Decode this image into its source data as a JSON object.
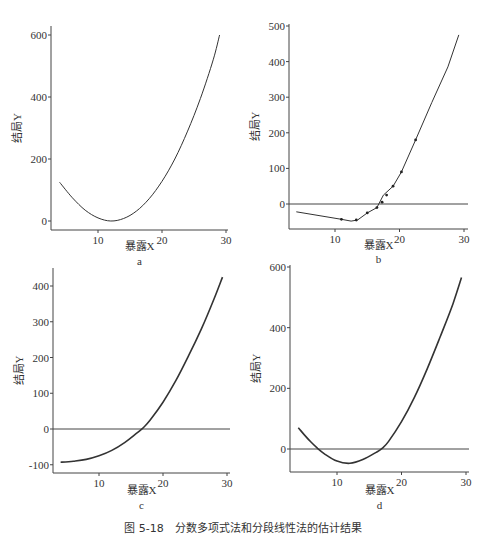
{
  "caption": "图 5-18　分数多项式法和分段线性法的估计结果",
  "chart_data": [
    {
      "id": "a",
      "type": "line",
      "subtitle": "a",
      "xlabel": "暴露X",
      "ylabel": "结局Y",
      "xlim": [
        3,
        30
      ],
      "ylim": [
        -25,
        620
      ],
      "xticks": [
        10,
        20,
        30
      ],
      "yticks": [
        0,
        200,
        400,
        600
      ],
      "zero_line": false,
      "grid": false,
      "series": [
        {
          "name": "fit",
          "x": [
            4,
            6,
            8,
            10,
            12,
            14,
            16,
            18,
            20,
            22,
            24,
            26,
            28,
            29
          ],
          "y": [
            125,
            75,
            35,
            10,
            0,
            8,
            32,
            72,
            128,
            200,
            290,
            395,
            520,
            600
          ]
        }
      ]
    },
    {
      "id": "b",
      "type": "line",
      "subtitle": "b",
      "xlabel": "暴露X",
      "ylabel": "结局Y",
      "xlim": [
        3,
        30
      ],
      "ylim": [
        -75,
        510
      ],
      "xticks": [
        10,
        20,
        30
      ],
      "yticks": [
        0,
        100,
        200,
        300,
        400,
        500
      ],
      "zero_line": true,
      "grid": false,
      "series": [
        {
          "name": "piecewise",
          "x": [
            4,
            11,
            12.5,
            13.5,
            15,
            16.5,
            17.5,
            19,
            20.3,
            22.5,
            25,
            27.5,
            29.2
          ],
          "y": [
            -22,
            -43,
            -48,
            -45,
            -25,
            -10,
            25,
            50,
            90,
            180,
            285,
            385,
            475
          ]
        },
        {
          "name": "knots",
          "type": "scatter",
          "x": [
            11,
            13.3,
            15,
            16.5,
            17.3,
            18,
            19,
            20.3,
            22.5
          ],
          "y": [
            -43,
            -45,
            -25,
            -10,
            5,
            25,
            50,
            90,
            180
          ]
        }
      ]
    },
    {
      "id": "c",
      "type": "line",
      "subtitle": "c",
      "xlabel": "暴露X",
      "ylabel": "结局Y",
      "xlim": [
        3,
        30
      ],
      "ylim": [
        -120,
        440
      ],
      "xticks": [
        10,
        20,
        30
      ],
      "yticks": [
        -100,
        0,
        100,
        200,
        300,
        400
      ],
      "zero_line": true,
      "grid": false,
      "series": [
        {
          "name": "fit",
          "x": [
            4,
            6,
            8,
            10,
            12,
            14,
            16,
            17,
            18,
            20,
            22,
            24,
            26,
            28,
            29.3
          ],
          "y": [
            -93,
            -90,
            -85,
            -75,
            -60,
            -38,
            -10,
            5,
            25,
            75,
            135,
            205,
            280,
            365,
            425
          ]
        }
      ]
    },
    {
      "id": "d",
      "type": "line",
      "subtitle": "d",
      "xlabel": "暴露X",
      "ylabel": "结局Y",
      "xlim": [
        3,
        30
      ],
      "ylim": [
        -80,
        610
      ],
      "xticks": [
        10,
        20,
        30
      ],
      "yticks": [
        0,
        200,
        400,
        600
      ],
      "zero_line": true,
      "grid": false,
      "series": [
        {
          "name": "fit",
          "x": [
            4,
            5,
            6,
            7,
            8,
            10,
            12,
            14,
            16,
            17,
            18,
            20,
            22,
            24,
            26,
            28,
            29.3
          ],
          "y": [
            70,
            45,
            22,
            2,
            -15,
            -40,
            -47,
            -35,
            -12,
            2,
            25,
            90,
            170,
            265,
            370,
            480,
            565
          ]
        }
      ]
    }
  ]
}
